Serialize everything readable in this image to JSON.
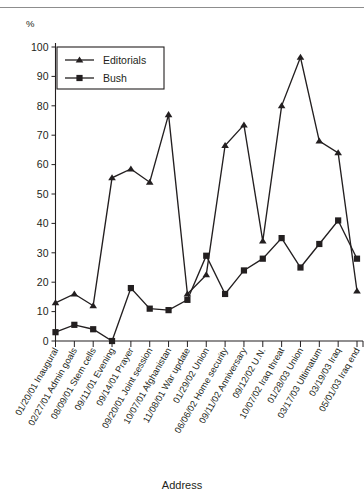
{
  "figure": {
    "y_unit_label": "%",
    "xlabel": "Address",
    "legend": {
      "entries": [
        {
          "label": "Editorials",
          "marker": "triangle"
        },
        {
          "label": "Bush",
          "marker": "square"
        }
      ]
    }
  },
  "chart_data": {
    "type": "line",
    "title": "",
    "xlabel": "Address",
    "ylabel": "%",
    "ylim": [
      0,
      100
    ],
    "yticks": [
      0,
      10,
      20,
      30,
      40,
      50,
      60,
      70,
      80,
      90,
      100
    ],
    "grid": false,
    "legend_position": "top-left",
    "categories": [
      "01/20/01 Inaugural",
      "02/27/01 Admin goals",
      "08/09/01 Stem cells",
      "09/11/01 Evening",
      "09/14/01 Prayer",
      "09/20/01 Joint session",
      "10/07/01 Afghanistan",
      "11/08/01 War update",
      "01/29/02 Union",
      "06/06/02 Home security",
      "09/11/02 Anniversary",
      "09/12/02 U.N.",
      "10/07/02 Iraq threat",
      "01/28/03 Union",
      "03/17/03 Ultimatum",
      "03/19/03 Iraq",
      "05/01/03 Iraq end"
    ],
    "series": [
      {
        "name": "Editorials",
        "marker": "triangle",
        "values": [
          13,
          16,
          12,
          55.5,
          58.5,
          54,
          77,
          16,
          22.5,
          66.5,
          73.5,
          34,
          80,
          96.5,
          68,
          64,
          17
        ]
      },
      {
        "name": "Bush",
        "marker": "square",
        "values": [
          3,
          5.5,
          4,
          0,
          18,
          11,
          10.5,
          14,
          29,
          16,
          24,
          28,
          35,
          25,
          33,
          41,
          28
        ]
      }
    ]
  }
}
